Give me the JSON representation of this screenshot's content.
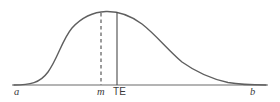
{
  "figure": {
    "name": "pert-beta-distribution-curve",
    "background_color": "#ffffff"
  },
  "chart_data": {
    "type": "line",
    "title": "",
    "subtitle": "",
    "xlabel": "",
    "ylabel": "",
    "grid": false,
    "legend": null,
    "axis": {
      "baseline_y": 85,
      "x_start": 12,
      "x_end": 268,
      "color": "#6b6b6b"
    },
    "curve": {
      "name": "probability-density",
      "color": "#5f5f5f",
      "stroke_width": 1.4,
      "skew": "right",
      "peak": {
        "x": 106,
        "y": 12
      },
      "left_tail_x": 14,
      "right_tail_x": 266,
      "path": "M 14 85 C 30 85, 40 83, 48 72 C 58 58, 62 40, 72 28 C 82 17, 94 12, 106 11.5 C 118 11.2, 130 15, 142 24 C 156 35, 168 50, 182 62 C 196 72, 212 79, 228 82.5 C 242 85, 256 85, 266 85"
    },
    "markers": [
      {
        "id": "mode-line",
        "label": "m",
        "label_style": "italic-serif",
        "x": 101,
        "y_top": 13,
        "y_bottom": 85,
        "line_style": "dashed",
        "dash_pattern": "3.5,3",
        "color": "#4a4a4a",
        "stroke_width": 1.1,
        "meaning": "mode (most likely time)"
      },
      {
        "id": "te-line",
        "label": "TE",
        "label_style": "upright-sans",
        "x": 117,
        "y_top": 12,
        "y_bottom": 85,
        "line_style": "solid",
        "color": "#4a4a4a",
        "stroke_width": 1.1,
        "meaning": "expected time"
      }
    ],
    "axis_endpoint_labels": [
      {
        "id": "a",
        "label": "a",
        "label_style": "italic-serif",
        "x": 16,
        "meaning": "optimistic time (lower bound)"
      },
      {
        "id": "b",
        "label": "b",
        "label_style": "italic-serif",
        "x": 252,
        "meaning": "pessimistic time (upper bound)"
      }
    ],
    "categories": [
      "a",
      "m",
      "TE",
      "b"
    ],
    "values": [
      0,
      1.0,
      0.985,
      0
    ]
  },
  "labels": {
    "a": "a",
    "m": "m",
    "te": "TE",
    "b": "b"
  },
  "colors": {
    "curve": "#5f5f5f",
    "axis": "#6b6b6b",
    "marker_line": "#4a4a4a",
    "text": "#3a3a3a",
    "background": "#ffffff"
  }
}
